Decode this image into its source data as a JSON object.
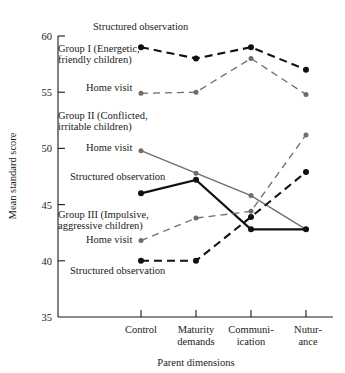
{
  "chart_data": {
    "type": "line",
    "title": "",
    "xlabel": "Parent dimensions",
    "ylabel": "Mean standard score",
    "categories": [
      "Control",
      "Maturity demands",
      "Communication",
      "Nurturance"
    ],
    "xtick_labels": [
      [
        "Control"
      ],
      [
        "Maturity",
        "demands"
      ],
      [
        "Communi-",
        "ication"
      ],
      [
        "Nutur-",
        "ance"
      ]
    ],
    "ylim": [
      35,
      60
    ],
    "yticks": [
      35,
      40,
      45,
      50,
      55,
      60
    ],
    "ytick_labels": [
      "35",
      "40",
      "45",
      "50",
      "55",
      "60"
    ],
    "grid": false,
    "legend": "inline-annotations",
    "series": [
      {
        "name": "Group I Structured observation",
        "group": "Group I",
        "measure": "Structured observation",
        "values": [
          59.0,
          58.0,
          59.0,
          57.0
        ],
        "color": "#111111",
        "style": "dashed",
        "width": 2.1
      },
      {
        "name": "Group I Home visit",
        "group": "Group I",
        "measure": "Home visit",
        "values": [
          54.9,
          55.0,
          58.0,
          54.8
        ],
        "color": "#6d6d6d",
        "style": "dashed",
        "width": 1.3
      },
      {
        "name": "Group II Home visit",
        "group": "Group II",
        "measure": "Home visit",
        "values": [
          49.8,
          47.8,
          45.8,
          42.8
        ],
        "color": "#6d6d6d",
        "style": "solid",
        "width": 1.3
      },
      {
        "name": "Group II Structured observation",
        "group": "Group II",
        "measure": "Structured observation",
        "values": [
          46.0,
          47.2,
          42.8,
          42.8
        ],
        "color": "#111111",
        "style": "solid",
        "width": 2.1
      },
      {
        "name": "Group III Home visit",
        "group": "Group III",
        "measure": "Home visit",
        "values": [
          41.8,
          43.8,
          44.4,
          51.2
        ],
        "color": "#6d6d6d",
        "style": "dashed",
        "width": 1.3
      },
      {
        "name": "Group III Structured observation",
        "group": "Group III",
        "measure": "Structured observation",
        "values": [
          40.0,
          40.0,
          43.9,
          47.9
        ],
        "color": "#111111",
        "style": "dashed",
        "width": 2.1
      }
    ],
    "annotations": [
      {
        "id": "ann-g1-structured",
        "text": "Structured observation",
        "x": 93,
        "y": 30,
        "anchor": "start"
      },
      {
        "id": "ann-group-1-line1",
        "text": "Group I (Energetic,",
        "x": 58,
        "y": 52,
        "anchor": "start"
      },
      {
        "id": "ann-group-1-line2",
        "text": "friendly children)",
        "x": 58,
        "y": 63,
        "anchor": "start"
      },
      {
        "id": "ann-g1-home",
        "text": "Home visit",
        "x": 86,
        "y": 91,
        "anchor": "start"
      },
      {
        "id": "ann-group-2-line1",
        "text": "Group II (Conflicted,",
        "x": 58,
        "y": 119,
        "anchor": "start"
      },
      {
        "id": "ann-group-2-line2",
        "text": "irritable children)",
        "x": 58,
        "y": 130,
        "anchor": "start"
      },
      {
        "id": "ann-g2-home",
        "text": "Home visit",
        "x": 86,
        "y": 151,
        "anchor": "start"
      },
      {
        "id": "ann-g2-structured",
        "text": "Structured observation",
        "x": 70,
        "y": 180,
        "anchor": "start"
      },
      {
        "id": "ann-group-3-line1",
        "text": "Group III (Impulsive,",
        "x": 58,
        "y": 218,
        "anchor": "start"
      },
      {
        "id": "ann-group-3-line2",
        "text": "aggressive children)",
        "x": 58,
        "y": 229,
        "anchor": "start"
      },
      {
        "id": "ann-g3-home",
        "text": "Home visit",
        "x": 86,
        "y": 243,
        "anchor": "start"
      },
      {
        "id": "ann-g3-structured",
        "text": "Structured observation",
        "x": 70,
        "y": 274,
        "anchor": "start"
      }
    ]
  }
}
